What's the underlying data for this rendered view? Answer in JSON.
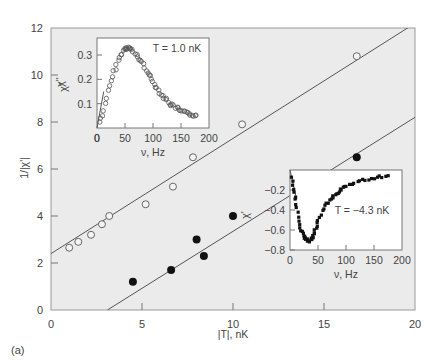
{
  "panel_label": "(a)",
  "chart_data": {
    "type": "scatter",
    "xlabel": "|T|, nK",
    "ylabel": "1/|χ'|",
    "xlim": [
      0,
      20
    ],
    "ylim": [
      0,
      12
    ],
    "xticks": [
      0,
      5,
      10,
      15,
      20
    ],
    "yticks": [
      0,
      2,
      4,
      6,
      8,
      10,
      12
    ],
    "grid": false,
    "background": "#ebebeb",
    "series": [
      {
        "name": "T > 0 (open circles)",
        "marker": "open-circle",
        "points": [
          [
            1.0,
            2.65
          ],
          [
            1.5,
            2.9
          ],
          [
            2.2,
            3.2
          ],
          [
            2.8,
            3.65
          ],
          [
            3.2,
            4.0
          ],
          [
            5.2,
            4.5
          ],
          [
            6.7,
            5.25
          ],
          [
            7.8,
            6.5
          ],
          [
            10.5,
            7.9
          ],
          [
            16.8,
            10.8
          ]
        ],
        "fit": {
          "x0": 0,
          "y0": 2.4,
          "x1": 20,
          "y1": 12.2
        }
      },
      {
        "name": "T < 0 (filled circles)",
        "marker": "filled-circle",
        "points": [
          [
            4.5,
            1.2
          ],
          [
            6.6,
            1.7
          ],
          [
            8.0,
            3.0
          ],
          [
            8.4,
            2.3
          ],
          [
            10.0,
            4.0
          ],
          [
            16.8,
            6.5
          ]
        ],
        "fit": {
          "x0": 3.1,
          "y0": 0,
          "x1": 20,
          "y1": 8.2
        }
      }
    ],
    "annotations": [
      {
        "text": "χ''",
        "near": "upper line",
        "rotated": true
      },
      {
        "text": "χ'",
        "near": "lower line",
        "rotated": true
      }
    ],
    "insets": [
      {
        "title": "T = 1.0 nK",
        "xlabel": "ν, Hz",
        "ylabel": "χ''",
        "xlim": [
          0,
          200
        ],
        "ylim": [
          0,
          0.37
        ],
        "xticks": [
          0,
          50,
          100,
          150,
          200
        ],
        "yticks": [
          0.1,
          0.2,
          0.3
        ],
        "marker": "open-circle",
        "curve": [
          [
            0,
            0
          ],
          [
            10,
            0.05
          ],
          [
            20,
            0.15
          ],
          [
            30,
            0.23
          ],
          [
            40,
            0.29
          ],
          [
            50,
            0.325
          ],
          [
            55,
            0.33
          ],
          [
            60,
            0.325
          ],
          [
            70,
            0.3
          ],
          [
            80,
            0.27
          ],
          [
            90,
            0.23
          ],
          [
            100,
            0.19
          ],
          [
            110,
            0.155
          ],
          [
            120,
            0.125
          ],
          [
            130,
            0.1
          ],
          [
            140,
            0.085
          ],
          [
            150,
            0.07
          ],
          [
            160,
            0.06
          ],
          [
            170,
            0.055
          ],
          [
            180,
            0.05
          ]
        ]
      },
      {
        "title": "T = −4.3 nK",
        "xlabel": "ν, Hz",
        "ylabel": "",
        "xlim": [
          0,
          200
        ],
        "ylim": [
          -0.8,
          0
        ],
        "xticks": [
          0,
          50,
          100,
          150,
          200
        ],
        "yticks": [
          -0.2,
          -0.4,
          -0.6,
          -0.8
        ],
        "marker": "filled-square",
        "curve": [
          [
            0,
            0
          ],
          [
            5,
            -0.15
          ],
          [
            10,
            -0.3
          ],
          [
            15,
            -0.48
          ],
          [
            20,
            -0.6
          ],
          [
            25,
            -0.66
          ],
          [
            30,
            -0.7
          ],
          [
            35,
            -0.71
          ],
          [
            40,
            -0.68
          ],
          [
            45,
            -0.6
          ],
          [
            50,
            -0.52
          ],
          [
            60,
            -0.38
          ],
          [
            70,
            -0.3
          ],
          [
            80,
            -0.24
          ],
          [
            90,
            -0.2
          ],
          [
            100,
            -0.16
          ],
          [
            120,
            -0.12
          ],
          [
            140,
            -0.09
          ],
          [
            160,
            -0.07
          ],
          [
            180,
            -0.06
          ]
        ]
      }
    ]
  }
}
